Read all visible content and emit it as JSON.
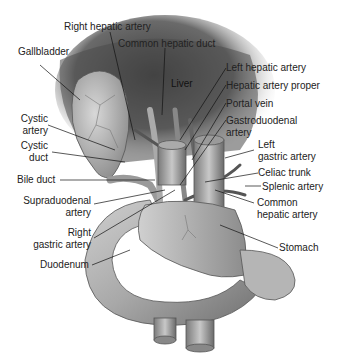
{
  "figure": {
    "labels": {
      "right_hepatic_artery": "Right hepatic artery",
      "common_hepatic_duct": "Common hepatic duct",
      "gallbladder": "Gallbladder",
      "liver": "Liver",
      "left_hepatic_artery": "Left hepatic artery",
      "hepatic_artery_proper": "Hepatic artery proper",
      "portal_vein": "Portal vein",
      "gastroduodenal_artery_1": "Gastroduodenal",
      "gastroduodenal_artery_2": "artery",
      "cystic_artery_1": "Cystic",
      "cystic_artery_2": "artery",
      "cystic_duct_1": "Cystic",
      "cystic_duct_2": "duct",
      "left_gastric_artery_1": "Left",
      "left_gastric_artery_2": "gastric artery",
      "bile_duct": "Bile duct",
      "celiac_trunk": "Celiac trunk",
      "splenic_artery": "Splenic artery",
      "supraduodenal_artery_1": "Supraduodenal",
      "supraduodenal_artery_2": "artery",
      "common_hepatic_artery_1": "Common",
      "common_hepatic_artery_2": "hepatic artery",
      "right_gastric_artery_1": "Right",
      "right_gastric_artery_2": "gastric artery",
      "stomach": "Stomach",
      "duodenum": "Duodenum"
    }
  }
}
